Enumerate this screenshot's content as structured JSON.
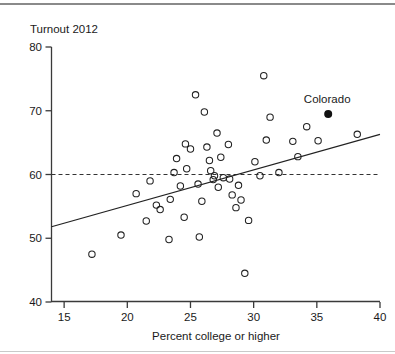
{
  "figure": {
    "ylabel_top": "Turnout 2012",
    "annotation": {
      "label": "Colorado",
      "x": 35.9,
      "y": 69.5
    }
  },
  "chart_data": {
    "type": "scatter",
    "title": "",
    "subtitle": "",
    "xlabel": "Percent college or higher",
    "ylabel": "Turnout 2012",
    "xlim": [
      14,
      40
    ],
    "ylim": [
      40,
      80
    ],
    "xticks": [
      15,
      20,
      25,
      30,
      35,
      40
    ],
    "yticks": [
      40,
      50,
      60,
      70,
      80
    ],
    "grid": false,
    "legend": null,
    "series": [
      {
        "name": "States",
        "marker": "open-circle",
        "color": "#222222",
        "points": [
          {
            "x": 17.2,
            "y": 47.5
          },
          {
            "x": 19.5,
            "y": 50.5
          },
          {
            "x": 20.7,
            "y": 57.0
          },
          {
            "x": 21.5,
            "y": 52.7
          },
          {
            "x": 21.8,
            "y": 59.0
          },
          {
            "x": 22.3,
            "y": 55.2
          },
          {
            "x": 22.6,
            "y": 54.5
          },
          {
            "x": 23.3,
            "y": 49.8
          },
          {
            "x": 23.4,
            "y": 56.1
          },
          {
            "x": 23.7,
            "y": 60.3
          },
          {
            "x": 23.9,
            "y": 62.5
          },
          {
            "x": 24.2,
            "y": 58.2
          },
          {
            "x": 24.5,
            "y": 53.3
          },
          {
            "x": 24.6,
            "y": 64.8
          },
          {
            "x": 24.7,
            "y": 60.9
          },
          {
            "x": 25.0,
            "y": 64.0
          },
          {
            "x": 25.4,
            "y": 72.5
          },
          {
            "x": 25.6,
            "y": 58.5
          },
          {
            "x": 25.7,
            "y": 50.2
          },
          {
            "x": 25.9,
            "y": 55.8
          },
          {
            "x": 26.1,
            "y": 69.8
          },
          {
            "x": 26.3,
            "y": 64.3
          },
          {
            "x": 26.5,
            "y": 62.2
          },
          {
            "x": 26.6,
            "y": 60.6
          },
          {
            "x": 26.8,
            "y": 59.2
          },
          {
            "x": 26.9,
            "y": 59.8
          },
          {
            "x": 27.1,
            "y": 66.5
          },
          {
            "x": 27.2,
            "y": 58.0
          },
          {
            "x": 27.4,
            "y": 62.7
          },
          {
            "x": 27.6,
            "y": 59.5
          },
          {
            "x": 28.0,
            "y": 64.7
          },
          {
            "x": 28.1,
            "y": 59.3
          },
          {
            "x": 28.3,
            "y": 56.8
          },
          {
            "x": 28.6,
            "y": 54.8
          },
          {
            "x": 28.8,
            "y": 58.3
          },
          {
            "x": 29.0,
            "y": 56.0
          },
          {
            "x": 29.3,
            "y": 44.5
          },
          {
            "x": 29.6,
            "y": 52.8
          },
          {
            "x": 30.1,
            "y": 62.0
          },
          {
            "x": 30.5,
            "y": 59.8
          },
          {
            "x": 30.8,
            "y": 75.5
          },
          {
            "x": 31.0,
            "y": 65.4
          },
          {
            "x": 31.3,
            "y": 69.0
          },
          {
            "x": 32.0,
            "y": 60.3
          },
          {
            "x": 33.1,
            "y": 65.2
          },
          {
            "x": 33.5,
            "y": 62.8
          },
          {
            "x": 34.2,
            "y": 67.5
          },
          {
            "x": 35.1,
            "y": 65.3
          },
          {
            "x": 38.2,
            "y": 66.3
          }
        ]
      },
      {
        "name": "Colorado",
        "marker": "filled-circle",
        "color": "#111111",
        "points": [
          {
            "x": 35.9,
            "y": 69.5
          }
        ]
      }
    ],
    "reference_lines": [
      {
        "name": "national-average",
        "orientation": "horizontal",
        "value": 60,
        "style": "dashed"
      }
    ],
    "fit_line": {
      "name": "regression-line",
      "style": "solid",
      "x_start": 14,
      "y_start": 51.8,
      "x_end": 40,
      "y_end": 66.3
    }
  }
}
